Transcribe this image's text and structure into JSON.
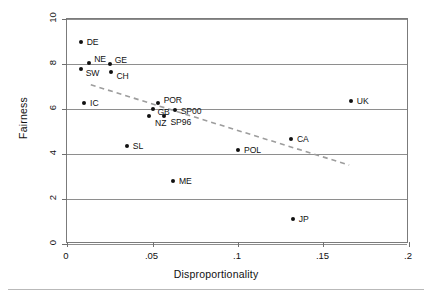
{
  "chart_data": {
    "type": "scatter",
    "title": "",
    "xlabel": "Disproportionality",
    "ylabel": "Fairness",
    "xlim": [
      0,
      0.2
    ],
    "ylim": [
      0,
      10
    ],
    "xticks": [
      "0",
      ".05",
      ".1",
      ".15",
      ".2"
    ],
    "xtick_values": [
      0,
      0.05,
      0.1,
      0.15,
      0.2
    ],
    "yticks": [
      "0",
      "2",
      "4",
      "6",
      "8",
      "10"
    ],
    "ytick_values": [
      0,
      2,
      4,
      6,
      8,
      10
    ],
    "grid": "horizontal",
    "legend": "none",
    "points": [
      {
        "label": "DE",
        "x": 0.008,
        "y": 9.0,
        "lx": 6,
        "ly": 0
      },
      {
        "label": "NE",
        "x": 0.013,
        "y": 8.05,
        "lx": 5,
        "ly": -4
      },
      {
        "label": "SW",
        "x": 0.008,
        "y": 7.8,
        "lx": 5,
        "ly": 4
      },
      {
        "label": "GE",
        "x": 0.025,
        "y": 8.0,
        "lx": 5,
        "ly": -4
      },
      {
        "label": "CH",
        "x": 0.026,
        "y": 7.65,
        "lx": 5,
        "ly": 4
      },
      {
        "label": "IC",
        "x": 0.01,
        "y": 6.25,
        "lx": 6,
        "ly": 0
      },
      {
        "label": "POR",
        "x": 0.053,
        "y": 6.25,
        "lx": 6,
        "ly": -3
      },
      {
        "label": "GB",
        "x": 0.05,
        "y": 6.0,
        "lx": 5,
        "ly": 3
      },
      {
        "label": "SP00",
        "x": 0.063,
        "y": 5.95,
        "lx": 6,
        "ly": 1
      },
      {
        "label": "SP96",
        "x": 0.057,
        "y": 5.7,
        "lx": 6,
        "ly": 6
      },
      {
        "label": "NZ",
        "x": 0.048,
        "y": 5.7,
        "lx": 6,
        "ly": 7
      },
      {
        "label": "UK",
        "x": 0.166,
        "y": 6.35,
        "lx": 6,
        "ly": 0
      },
      {
        "label": "CA",
        "x": 0.131,
        "y": 4.65,
        "lx": 6,
        "ly": 0
      },
      {
        "label": "POL",
        "x": 0.1,
        "y": 4.2,
        "lx": 6,
        "ly": 0
      },
      {
        "label": "SL",
        "x": 0.035,
        "y": 4.35,
        "lx": 6,
        "ly": 0
      },
      {
        "label": "ME",
        "x": 0.062,
        "y": 2.8,
        "lx": 6,
        "ly": 0
      },
      {
        "label": "JP",
        "x": 0.132,
        "y": 1.1,
        "lx": 6,
        "ly": 0
      }
    ],
    "trendline": {
      "style": "dashed",
      "color": "#9d9d9d",
      "x0": 0.014,
      "y0": 7.05,
      "x1": 0.166,
      "y1": 3.45
    }
  }
}
